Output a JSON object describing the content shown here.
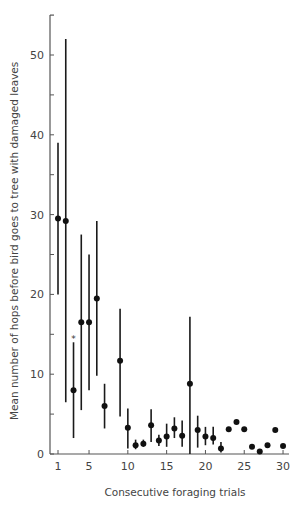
{
  "chart_data": {
    "type": "scatter",
    "title": "",
    "xlabel": "Consecutive foraging trials",
    "ylabel": "Mean number of hops before bird goes to tree with damaged leaves",
    "xlim": [
      1,
      30
    ],
    "ylim": [
      0,
      55
    ],
    "x_ticks": [
      1,
      5,
      10,
      15,
      20,
      25,
      30
    ],
    "y_ticks": [
      0,
      10,
      20,
      30,
      40,
      50
    ],
    "y_minor_ticks": [
      5,
      15,
      25,
      35,
      45
    ],
    "grid": false,
    "legend": null,
    "error_bars": true,
    "annotations": [
      {
        "x": 3,
        "y": 14.5,
        "text": "*"
      }
    ],
    "points": [
      {
        "x": 1,
        "y": 29.5,
        "lo": 20.0,
        "hi": 39.0
      },
      {
        "x": 2,
        "y": 29.2,
        "lo": 6.5,
        "hi": 52.0
      },
      {
        "x": 3,
        "y": 8.0,
        "lo": 2.0,
        "hi": 14.0
      },
      {
        "x": 4,
        "y": 16.5,
        "lo": 5.5,
        "hi": 27.5
      },
      {
        "x": 5,
        "y": 16.5,
        "lo": 8.0,
        "hi": 25.0
      },
      {
        "x": 6,
        "y": 19.5,
        "lo": 9.8,
        "hi": 29.2
      },
      {
        "x": 7,
        "y": 6.0,
        "lo": 3.2,
        "hi": 8.8
      },
      {
        "x": 9,
        "y": 11.7,
        "lo": 4.7,
        "hi": 18.2
      },
      {
        "x": 10,
        "y": 3.3,
        "lo": 0.7,
        "hi": 5.7
      },
      {
        "x": 11,
        "y": 1.1,
        "lo": 0.6,
        "hi": 1.8
      },
      {
        "x": 12,
        "y": 1.3,
        "lo": 0.9,
        "hi": 1.8
      },
      {
        "x": 13,
        "y": 3.6,
        "lo": 1.5,
        "hi": 5.6
      },
      {
        "x": 14,
        "y": 1.7,
        "lo": 1.0,
        "hi": 2.4
      },
      {
        "x": 15,
        "y": 2.2,
        "lo": 0.9,
        "hi": 3.8
      },
      {
        "x": 16,
        "y": 3.2,
        "lo": 2.0,
        "hi": 4.6
      },
      {
        "x": 17,
        "y": 2.3,
        "lo": 0.9,
        "hi": 4.2
      },
      {
        "x": 18,
        "y": 8.8,
        "lo": 0.0,
        "hi": 17.2
      },
      {
        "x": 19,
        "y": 3.0,
        "lo": 0.8,
        "hi": 4.8
      },
      {
        "x": 20,
        "y": 2.2,
        "lo": 1.1,
        "hi": 3.4
      },
      {
        "x": 21,
        "y": 2.0,
        "lo": 1.2,
        "hi": 3.4
      },
      {
        "x": 22,
        "y": 0.7,
        "lo": 0.2,
        "hi": 1.5
      },
      {
        "x": 23,
        "y": 3.1
      },
      {
        "x": 24,
        "y": 4.0
      },
      {
        "x": 25,
        "y": 3.1
      },
      {
        "x": 26,
        "y": 0.9
      },
      {
        "x": 27,
        "y": 0.3
      },
      {
        "x": 28,
        "y": 1.1
      },
      {
        "x": 29,
        "y": 3.0
      },
      {
        "x": 30,
        "y": 1.0
      }
    ]
  },
  "axes": {
    "xlabel": "Consecutive foraging trials",
    "ylabel": "Mean number of hops before bird goes to tree with damaged leaves"
  }
}
